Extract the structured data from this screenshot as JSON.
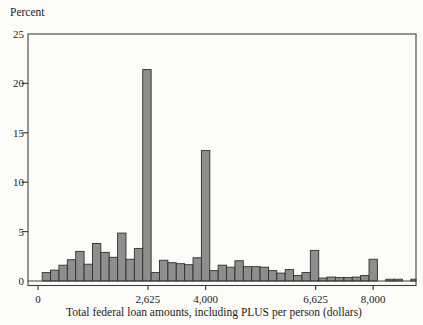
{
  "chart_data": {
    "type": "bar",
    "subtype": "histogram",
    "title": "",
    "ylabel": "Percent",
    "xlabel": "Total federal loan amounts, including PLUS per person (dollars)",
    "ylim": [
      0,
      25
    ],
    "xlim": [
      -250,
      9050
    ],
    "grid": false,
    "legend": false,
    "y_ticks": [
      0,
      5,
      10,
      15,
      20,
      25
    ],
    "x_ticks": [
      {
        "value": 0,
        "label": "0"
      },
      {
        "value": 2625,
        "label": "2,625"
      },
      {
        "value": 4000,
        "label": "4,000"
      },
      {
        "value": 6625,
        "label": "6,625"
      },
      {
        "value": 8000,
        "label": "8,000"
      }
    ],
    "bin_width_dollars": 200,
    "bins": [
      {
        "start": 100,
        "percent": 0.85
      },
      {
        "start": 300,
        "percent": 1.1
      },
      {
        "start": 500,
        "percent": 1.6
      },
      {
        "start": 700,
        "percent": 2.15
      },
      {
        "start": 900,
        "percent": 3.0
      },
      {
        "start": 1100,
        "percent": 1.7
      },
      {
        "start": 1300,
        "percent": 3.8
      },
      {
        "start": 1500,
        "percent": 2.9
      },
      {
        "start": 1700,
        "percent": 2.4
      },
      {
        "start": 1900,
        "percent": 4.85
      },
      {
        "start": 2100,
        "percent": 2.2
      },
      {
        "start": 2300,
        "percent": 3.3
      },
      {
        "start": 2500,
        "percent": 21.4
      },
      {
        "start": 2700,
        "percent": 0.85
      },
      {
        "start": 2900,
        "percent": 2.1
      },
      {
        "start": 3100,
        "percent": 1.85
      },
      {
        "start": 3300,
        "percent": 1.75
      },
      {
        "start": 3500,
        "percent": 1.65
      },
      {
        "start": 3700,
        "percent": 2.35
      },
      {
        "start": 3900,
        "percent": 13.2
      },
      {
        "start": 4100,
        "percent": 1.05
      },
      {
        "start": 4300,
        "percent": 1.6
      },
      {
        "start": 4500,
        "percent": 1.4
      },
      {
        "start": 4700,
        "percent": 2.05
      },
      {
        "start": 4900,
        "percent": 1.45
      },
      {
        "start": 5100,
        "percent": 1.45
      },
      {
        "start": 5300,
        "percent": 1.4
      },
      {
        "start": 5500,
        "percent": 1.05
      },
      {
        "start": 5700,
        "percent": 0.8
      },
      {
        "start": 5900,
        "percent": 1.15
      },
      {
        "start": 6100,
        "percent": 0.55
      },
      {
        "start": 6300,
        "percent": 0.85
      },
      {
        "start": 6500,
        "percent": 3.1
      },
      {
        "start": 6700,
        "percent": 0.3
      },
      {
        "start": 6900,
        "percent": 0.4
      },
      {
        "start": 7100,
        "percent": 0.35
      },
      {
        "start": 7300,
        "percent": 0.35
      },
      {
        "start": 7500,
        "percent": 0.4
      },
      {
        "start": 7700,
        "percent": 0.55
      },
      {
        "start": 7900,
        "percent": 2.2
      },
      {
        "start": 8100,
        "percent": 0
      },
      {
        "start": 8300,
        "percent": 0.18
      },
      {
        "start": 8500,
        "percent": 0.18
      },
      {
        "start": 8700,
        "percent": 0
      },
      {
        "start": 8900,
        "percent": 0.18
      }
    ]
  },
  "colors": {
    "background": "#fcfcf9",
    "bar_fill": "#8e8e8e",
    "bar_stroke": "#2f2f2f",
    "axis": "#3f3f3f",
    "text": "#1c1c1c"
  }
}
